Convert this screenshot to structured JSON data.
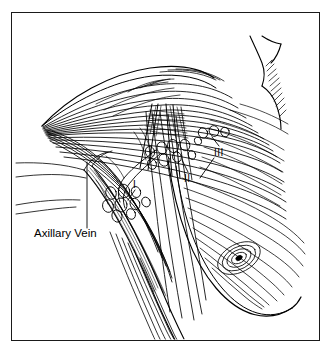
{
  "figure": {
    "type": "medical-line-illustration",
    "border_color": "#1a1a1a",
    "ink_color": "#000000",
    "background_color": "#ffffff",
    "width": 332,
    "height": 355
  },
  "labels": {
    "axillary_vein": "Axillary Vein",
    "level_1": "I",
    "level_2": "II",
    "level_3": "III"
  },
  "annotations": [
    {
      "name": "axillary-vein-label",
      "text": "Axillary Vein",
      "x": 34,
      "y": 233,
      "leader": true
    },
    {
      "name": "level-i-label",
      "text": "I",
      "x": 135,
      "y": 184
    },
    {
      "name": "level-ii-label",
      "text": "II",
      "x": 186,
      "y": 180
    },
    {
      "name": "level-iii-label",
      "text": "III",
      "x": 217,
      "y": 153
    }
  ],
  "structures": [
    {
      "name": "pectoralis-major-muscle",
      "description": "fan of fibers converging to left apex"
    },
    {
      "name": "pectoralis-minor-muscle",
      "description": "crosshatched band crossing axilla"
    },
    {
      "name": "axillary-vein",
      "description": "striped tubular vessel descending to lower left"
    },
    {
      "name": "brachial-plexus-strands",
      "description": "long nerve strands descending"
    },
    {
      "name": "breast-contour",
      "description": "large curved breast outline lower right"
    },
    {
      "name": "nipple-areola",
      "description": "concentric spiral lower right"
    },
    {
      "name": "neck-shoulder-contour",
      "description": "upper right body outline with hatching"
    },
    {
      "name": "lymph-nodes-level-i",
      "count": 9
    },
    {
      "name": "lymph-nodes-level-ii",
      "count": 8
    },
    {
      "name": "lymph-nodes-level-iii",
      "count": 4
    }
  ]
}
